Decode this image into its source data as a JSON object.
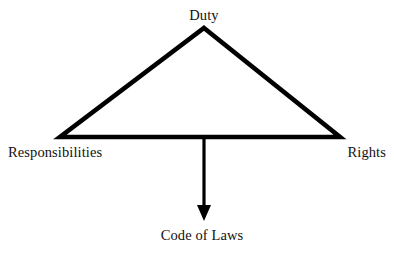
{
  "diagram": {
    "title_text": "",
    "background_color": "#ffffff",
    "stroke_color": "#000000",
    "text_color": "#111111",
    "type": "triangle-with-downward-arrow",
    "nodes": {
      "apex": {
        "label": "Duty"
      },
      "bottom_left": {
        "label": "Responsibilities"
      },
      "bottom_right": {
        "label": "Rights"
      },
      "arrow_target": {
        "label": "Code of Laws"
      }
    },
    "geometry": {
      "apex_point": "204,28",
      "left_point": "60,137",
      "right_point": "340,137",
      "arrow_start": "204,137",
      "arrow_tip": "204,220",
      "stroke_width": "4.5"
    }
  }
}
